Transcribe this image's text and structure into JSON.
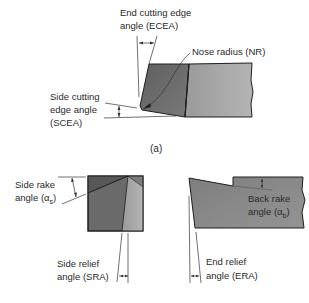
{
  "figure": {
    "caption": "(a)",
    "top_view": {
      "ecea_label_line1": "End cutting edge",
      "ecea_label_line2": "angle (ECEA)",
      "nose_radius_label": "Nose radius (NR)",
      "scea_label_line1": "Side cutting",
      "scea_label_line2": "edge angle",
      "scea_label_line3": "(SCEA)"
    },
    "side_view": {
      "side_rake_line1": "Side rake",
      "side_rake_line2": "angle (α",
      "side_rake_sub": "s",
      "side_relief_line1": "Side relief",
      "side_relief_line2": "angle (SRA)"
    },
    "end_view": {
      "back_rake_line1": "Back rake",
      "back_rake_line2": "angle (α",
      "back_rake_sub": "b",
      "end_relief_line1": "End relief",
      "end_relief_line2": "angle (ERA)"
    }
  },
  "colors": {
    "dark_face": "#6e6e6e",
    "light_face": "#a3a3a3",
    "outline": "#1e1e1e",
    "text": "#2a2a2a"
  }
}
